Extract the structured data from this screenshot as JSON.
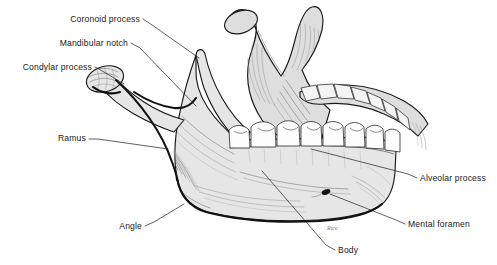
{
  "figure": {
    "background_color": "#ffffff",
    "bone_fill_color": "#e6e6e6",
    "outline_color": "#1a1a1a",
    "label_color": "#1a1a1a",
    "signature": "Rice"
  },
  "labels": [
    {
      "id": "coronoid-process",
      "text": "Coronoid process",
      "side": "left",
      "text_x": 140,
      "text_y": 22,
      "leader": "M 143 19 L 152 25 L 199 58"
    },
    {
      "id": "mandibular-notch",
      "text": "Mandibular notch",
      "side": "left",
      "text_x": 128,
      "text_y": 46,
      "leader": "M 131 43 L 140 48 L 196 106"
    },
    {
      "id": "condylar-process",
      "text": "Condylar process",
      "side": "left",
      "text_x": 92,
      "text_y": 70,
      "leader": "M 95 67 L 104 72 L 124 84"
    },
    {
      "id": "ramus",
      "text": "Ramus",
      "side": "left",
      "text_x": 86,
      "text_y": 141,
      "leader": "M 89 139 L 98 139 L 168 149"
    },
    {
      "id": "angle",
      "text": "Angle",
      "side": "left",
      "text_x": 142,
      "text_y": 229,
      "leader": "M 145 226 L 154 222 L 184 204"
    },
    {
      "id": "alveolar-process",
      "text": "Alveolar process",
      "side": "right",
      "text_x": 420,
      "text_y": 181,
      "leader": "M 417 178 L 408 174 L 311 149"
    },
    {
      "id": "mental-foramen",
      "text": "Mental foramen",
      "side": "right",
      "text_x": 408,
      "text_y": 227,
      "leader": "M 405 224 L 396 220 L 330 194"
    },
    {
      "id": "body",
      "text": "Body",
      "side": "bottom",
      "text_x": 338,
      "text_y": 253,
      "leader": "M 335 250 L 326 245 L 262 171"
    }
  ],
  "teeth": {
    "near_arch_count": 8,
    "far_arch_count": 7,
    "near_arch_label": "lower-dental-arch-near",
    "far_arch_label": "lower-dental-arch-far"
  },
  "structures": [
    {
      "id": "near-ramus",
      "name": "ramus-near"
    },
    {
      "id": "near-condyle",
      "name": "condylar-head-near"
    },
    {
      "id": "near-coronoid",
      "name": "coronoid-process-near"
    },
    {
      "id": "mandible-body",
      "name": "body-of-mandible"
    },
    {
      "id": "far-ramus",
      "name": "ramus-far"
    },
    {
      "id": "far-condyle",
      "name": "condylar-head-far"
    },
    {
      "id": "far-coronoid",
      "name": "coronoid-process-far"
    },
    {
      "id": "mental-foramen-mark",
      "name": "mental-foramen-opening"
    }
  ]
}
